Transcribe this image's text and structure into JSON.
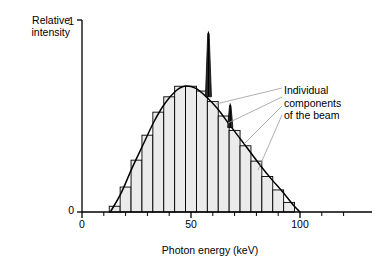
{
  "figure": {
    "background_color": "#ffffff",
    "ink_color": "#000000",
    "bar_fill_color": "#ebebeb",
    "bar_edge_color": "#000000",
    "leader_line_color": "#9a9a9a"
  },
  "axes": {
    "y_label_line1": "Relative",
    "y_label_line2": "intensity",
    "y_ticks": [
      "1",
      "0"
    ],
    "y_tick_top": "1",
    "y_tick_bottom": "0",
    "x_label": "Photon energy (keV)",
    "x_ticks": [
      "0",
      "50",
      "100"
    ],
    "x_tick_0": "0",
    "x_tick_50": "50",
    "x_tick_100": "100"
  },
  "annotation": {
    "line1": "Individual",
    "line2": "components",
    "line3": "of the beam",
    "full_text": "Individual components of the beam",
    "leader_count": 4
  },
  "chart_data": {
    "type": "bar",
    "title": "",
    "subtitle": "",
    "xlabel": "Photon energy (keV)",
    "ylabel": "Relative intensity",
    "xlim": [
      0,
      130
    ],
    "ylim": [
      0,
      1
    ],
    "x_ticks_major": [
      0,
      50,
      100
    ],
    "x_ticks_minor": [
      10,
      20,
      30,
      40,
      60,
      70,
      80,
      90,
      110,
      120
    ],
    "y_ticks_major": [
      0,
      1
    ],
    "grid": false,
    "legend": null,
    "legend_position": "none",
    "bin_width_kev": 5,
    "categories": [
      15,
      20,
      25,
      30,
      35,
      40,
      45,
      50,
      55,
      60,
      65,
      70,
      75,
      80,
      85,
      90,
      95
    ],
    "values": [
      0.03,
      0.13,
      0.27,
      0.4,
      0.52,
      0.6,
      0.655,
      0.655,
      0.63,
      0.575,
      0.5,
      0.425,
      0.345,
      0.265,
      0.185,
      0.115,
      0.05
    ],
    "series": [
      {
        "name": "Individual components of the beam",
        "type": "bar",
        "values": [
          0.03,
          0.13,
          0.27,
          0.4,
          0.52,
          0.6,
          0.655,
          0.655,
          0.63,
          0.575,
          0.5,
          0.425,
          0.345,
          0.265,
          0.185,
          0.115,
          0.05
        ]
      },
      {
        "name": "Continuous bremsstrahlung envelope",
        "type": "line",
        "x": [
          13,
          18,
          23,
          28,
          33,
          38,
          43,
          47,
          52,
          57,
          62,
          67,
          72,
          77,
          82,
          87,
          92,
          97,
          100
        ],
        "values": [
          0.0,
          0.1,
          0.23,
          0.35,
          0.47,
          0.565,
          0.63,
          0.655,
          0.645,
          0.6,
          0.54,
          0.465,
          0.39,
          0.315,
          0.24,
          0.17,
          0.105,
          0.035,
          0.0
        ]
      },
      {
        "name": "Characteristic peaks",
        "type": "line",
        "x": [
          58,
          68
        ],
        "values": [
          0.93,
          0.555
        ],
        "labels": [
          "K-alpha",
          "K-beta"
        ]
      }
    ],
    "envelope_peak_energy_kev": 47,
    "envelope_peak_value": 0.655,
    "spectrum_start_kev": 13,
    "spectrum_end_kev": 100
  }
}
